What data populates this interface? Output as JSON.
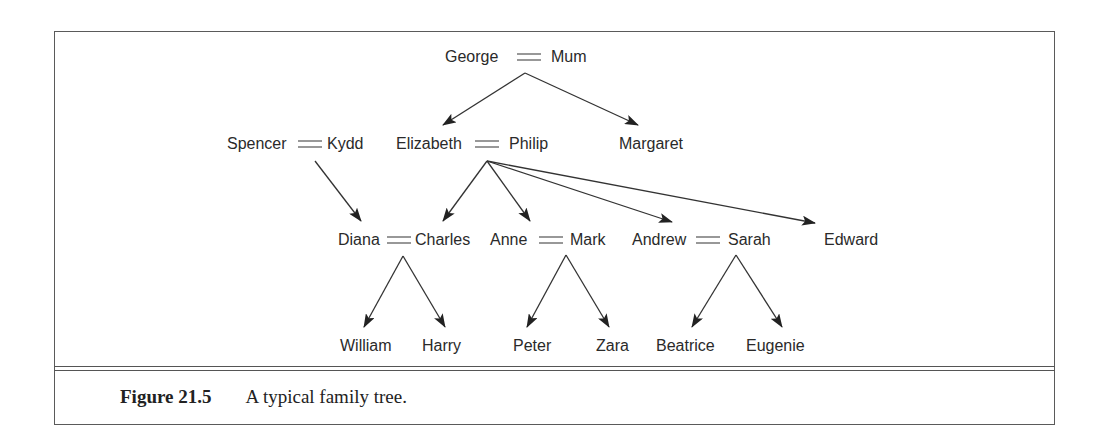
{
  "figure": {
    "label": "Figure 21.5",
    "caption": "A typical family tree."
  },
  "nodes": {
    "george": "George",
    "mum": "Mum",
    "spencer": "Spencer",
    "kydd": "Kydd",
    "elizabeth": "Elizabeth",
    "philip": "Philip",
    "margaret": "Margaret",
    "diana": "Diana",
    "charles": "Charles",
    "anne": "Anne",
    "mark": "Mark",
    "andrew": "Andrew",
    "sarah": "Sarah",
    "edward": "Edward",
    "william": "William",
    "harry": "Harry",
    "peter": "Peter",
    "zara": "Zara",
    "beatrice": "Beatrice",
    "eugenie": "Eugenie"
  },
  "marriages": [
    [
      "George",
      "Mum"
    ],
    [
      "Spencer",
      "Kydd"
    ],
    [
      "Elizabeth",
      "Philip"
    ],
    [
      "Diana",
      "Charles"
    ],
    [
      "Anne",
      "Mark"
    ],
    [
      "Andrew",
      "Sarah"
    ]
  ],
  "parent_child_edges": [
    {
      "parents": "George = Mum",
      "child": "Elizabeth"
    },
    {
      "parents": "George = Mum",
      "child": "Margaret"
    },
    {
      "parents": "Spencer = Kydd",
      "child": "Diana"
    },
    {
      "parents": "Elizabeth = Philip",
      "child": "Charles"
    },
    {
      "parents": "Elizabeth = Philip",
      "child": "Anne"
    },
    {
      "parents": "Elizabeth = Philip",
      "child": "Andrew"
    },
    {
      "parents": "Elizabeth = Philip",
      "child": "Edward"
    },
    {
      "parents": "Diana = Charles",
      "child": "William"
    },
    {
      "parents": "Diana = Charles",
      "child": "Harry"
    },
    {
      "parents": "Anne = Mark",
      "child": "Peter"
    },
    {
      "parents": "Anne = Mark",
      "child": "Zara"
    },
    {
      "parents": "Andrew = Sarah",
      "child": "Beatrice"
    },
    {
      "parents": "Andrew = Sarah",
      "child": "Eugenie"
    }
  ]
}
